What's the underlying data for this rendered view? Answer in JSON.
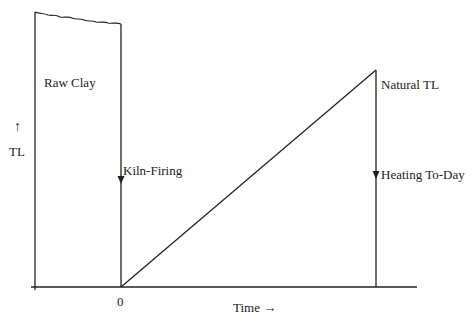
{
  "diagram": {
    "labels": {
      "raw_clay": "Raw Clay",
      "y_axis_arrow": "↑",
      "y_axis": "TL",
      "kiln_firing": "Kiln-Firing",
      "natural_tl": "Natural TL",
      "heating_today": "Heating To-Day",
      "origin": "0",
      "x_axis": "Time →"
    },
    "colors": {
      "line": "#222222",
      "background": "#ffffff"
    }
  }
}
